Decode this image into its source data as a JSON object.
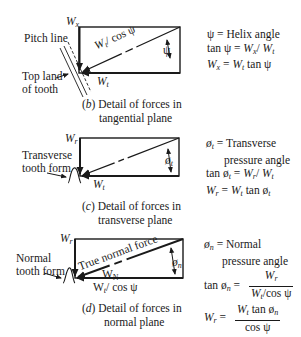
{
  "panel_b": {
    "caption_letter": "b",
    "caption_line1": "Detail of forces in",
    "caption_line2": "tangential plane",
    "labels": {
      "wx": "W",
      "wx_sub": "x",
      "wt": "W",
      "wt_sub": "t",
      "hyp": "W",
      "hyp_sub": "t",
      "hyp_rest": "/ cos ψ",
      "angle": "ψ",
      "pitch_line": "Pitch line",
      "top_land_1": "Top land",
      "top_land_2": "of tooth"
    },
    "equations": {
      "line1": "ψ = Helix angle",
      "line2_prefix": "tan ψ = ",
      "line2_a": "W",
      "line2_a_sub": "x",
      "line2_b": "W",
      "line2_b_sub": "t",
      "line3_a": "W",
      "line3_a_sub": "x",
      "line3_eq": " = ",
      "line3_b": "W",
      "line3_b_sub": "t",
      "line3_rest": " tan ψ"
    }
  },
  "panel_c": {
    "caption_letter": "c",
    "caption_line1": "Detail of forces in",
    "caption_line2": "transverse plane",
    "labels": {
      "wr": "W",
      "wr_sub": "r",
      "wt": "W",
      "wt_sub": "t",
      "angle": "ø",
      "angle_sub": "t",
      "tooth_form_1": "Transverse",
      "tooth_form_2": "tooth form"
    },
    "equations": {
      "line1_sym": "ø",
      "line1_sub": "t",
      "line1_rest": " = Transverse",
      "line2": "pressure angle",
      "line3_prefix": "tan ø",
      "line3_sub": "t",
      "line3_eq": " = ",
      "line3_a": "W",
      "line3_a_sub": "r",
      "line3_b": "W",
      "line3_b_sub": "t",
      "line4_a": "W",
      "line4_a_sub": "r",
      "line4_eq": " = ",
      "line4_b": "W",
      "line4_b_sub": "t",
      "line4_rest": " tan ø",
      "line4_rest_sub": "t"
    }
  },
  "panel_d": {
    "caption_letter": "d",
    "caption_line1": "Detail of forces in",
    "caption_line2": "normal plane",
    "labels": {
      "wr": "W",
      "wr_sub": "r",
      "true_normal": "True normal force",
      "wn": "W",
      "wn_sub": "N",
      "bottom": "W",
      "bottom_sub": "t",
      "bottom_rest": "/ cos ψ",
      "angle": "ø",
      "angle_sub": "n",
      "tooth_form_1": "Normal",
      "tooth_form_2": "tooth form"
    },
    "equations": {
      "line1_sym": "ø",
      "line1_sub": "n",
      "line1_rest": " = Normal",
      "line2": "pressure angle",
      "line3_prefix": "tan ø",
      "line3_sub": "n",
      "line3_eq": " =",
      "line3_num": "W",
      "line3_num_sub": "r",
      "line3_den": "W",
      "line3_den_sub": "t",
      "line3_den_rest": "/cos ψ",
      "line4_a": "W",
      "line4_a_sub": "r",
      "line4_eq": " =",
      "line4_num": "W",
      "line4_num_sub": "t",
      "line4_num_rest": " tan ø",
      "line4_num_rest_sub": "n",
      "line4_den": "cos ψ"
    }
  }
}
